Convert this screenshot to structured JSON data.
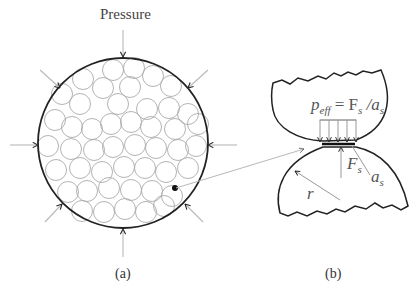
{
  "panel_a": {
    "title": "Pressure",
    "caption": "(a)",
    "outer_circle": {
      "cx": 123,
      "cy": 143,
      "r": 85
    },
    "grain_radius": 10.5,
    "grains": [
      [
        113,
        70
      ],
      [
        134,
        68
      ],
      [
        153,
        76
      ],
      [
        83,
        79
      ],
      [
        103,
        88
      ],
      [
        130,
        87
      ],
      [
        171,
        86
      ],
      [
        62,
        94
      ],
      [
        80,
        104
      ],
      [
        118,
        104
      ],
      [
        147,
        109
      ],
      [
        169,
        108
      ],
      [
        188,
        114
      ],
      [
        55,
        120
      ],
      [
        72,
        127
      ],
      [
        92,
        129
      ],
      [
        111,
        124
      ],
      [
        131,
        122
      ],
      [
        151,
        127
      ],
      [
        175,
        129
      ],
      [
        198,
        124
      ],
      [
        48,
        146
      ],
      [
        71,
        149
      ],
      [
        94,
        150
      ],
      [
        113,
        147
      ],
      [
        135,
        145
      ],
      [
        156,
        148
      ],
      [
        178,
        150
      ],
      [
        196,
        146
      ],
      [
        56,
        170
      ],
      [
        80,
        168
      ],
      [
        102,
        172
      ],
      [
        124,
        167
      ],
      [
        145,
        168
      ],
      [
        166,
        172
      ],
      [
        188,
        168
      ],
      [
        68,
        192
      ],
      [
        87,
        191
      ],
      [
        109,
        188
      ],
      [
        131,
        190
      ],
      [
        152,
        191
      ],
      [
        172,
        196
      ],
      [
        82,
        211
      ],
      [
        104,
        212
      ],
      [
        125,
        209
      ],
      [
        146,
        212
      ],
      [
        164,
        206
      ]
    ],
    "marked_grain": {
      "x": 175,
      "y": 188
    },
    "arrows": [
      {
        "from": [
          123,
          30
        ],
        "to": [
          123,
          57
        ]
      },
      {
        "from": [
          40,
          70
        ],
        "to": [
          60,
          88
        ]
      },
      {
        "from": [
          208,
          70
        ],
        "to": [
          188,
          88
        ]
      },
      {
        "from": [
          10,
          145
        ],
        "to": [
          38,
          145
        ]
      },
      {
        "from": [
          237,
          145
        ],
        "to": [
          208,
          145
        ]
      },
      {
        "from": [
          45,
          222
        ],
        "to": [
          62,
          204
        ]
      },
      {
        "from": [
          203,
          222
        ],
        "to": [
          185,
          204
        ]
      },
      {
        "from": [
          123,
          257
        ],
        "to": [
          123,
          229
        ]
      }
    ]
  },
  "panel_b": {
    "caption": "(b)",
    "formula": {
      "p": "p",
      "p_sub": "eff",
      "eq": " = F",
      "f_sub": "s",
      "slash": " /a",
      "a_sub": "s"
    },
    "force_label": {
      "main": "F",
      "sub": "s"
    },
    "area_label": {
      "main": "a",
      "sub": "s"
    },
    "radius_label": "r",
    "connector": {
      "from": [
        176,
        188
      ],
      "to": [
        304,
        149
      ]
    }
  },
  "colors": {
    "outline": "#222222",
    "grain": "#aaaaaa",
    "arrow": "#b8b8b8",
    "arrowhead": "#222222",
    "text": "#444444"
  }
}
